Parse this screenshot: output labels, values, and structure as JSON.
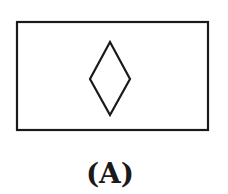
{
  "figure": {
    "label": "(A)",
    "stroke_color": "#1a1a1a",
    "background": "#ffffff",
    "shapes": [
      {
        "type": "rectangle",
        "name": "outer-rectangle",
        "x": 17,
        "y": 22,
        "width": 191,
        "height": 108
      },
      {
        "type": "diamond",
        "name": "inner-diamond",
        "points": [
          [
            110,
            42
          ],
          [
            130,
            79
          ],
          [
            110,
            115
          ],
          [
            90,
            79
          ]
        ]
      }
    ]
  }
}
